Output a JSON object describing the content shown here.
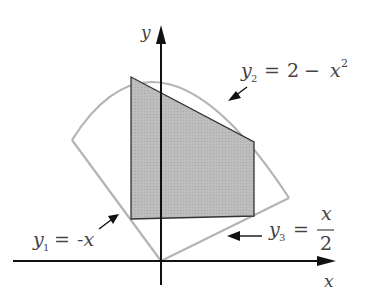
{
  "diagram": {
    "axes": {
      "x_label": "x",
      "y_label": "y"
    },
    "curves": [
      {
        "id": "y1",
        "label_var": "y",
        "label_sub": "1",
        "label_eq": "=",
        "label_rhs": "-x",
        "equation": "y1 = -x"
      },
      {
        "id": "y2",
        "label_var": "y",
        "label_sub": "2",
        "label_eq": "=",
        "label_rhs_const": "2",
        "label_minus": "−",
        "label_rhs_var": "x",
        "label_rhs_exp": "2",
        "equation": "y2 = 2 - x^2"
      },
      {
        "id": "y3",
        "label_var": "y",
        "label_sub": "3",
        "label_eq": "=",
        "label_num": "x",
        "label_den": "2",
        "equation": "y3 = x/2"
      }
    ],
    "colors": {
      "curve": "#b4b4b4",
      "axis": "#111111",
      "shade": "#b9b9b9",
      "shade_edge": "#333333"
    }
  }
}
